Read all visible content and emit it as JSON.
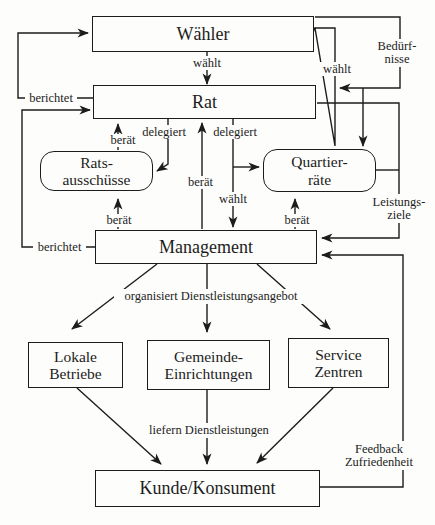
{
  "diagram": {
    "type": "flowchart",
    "language": "de",
    "colors": {
      "line": "#1c1c1c",
      "background": "#fdfdfb",
      "text": "#1c1c1c"
    },
    "nodes": {
      "waehler": {
        "label": "Wähler"
      },
      "rat": {
        "label": "Rat"
      },
      "ratsausschuesse": {
        "line1": "Rats-",
        "line2": "ausschüsse"
      },
      "quartierraete": {
        "line1": "Quartier-",
        "line2": "räte"
      },
      "management": {
        "label": "Management"
      },
      "lokale_betriebe": {
        "line1": "Lokale",
        "line2": "Betriebe"
      },
      "gemeinde_einrichtungen": {
        "line1": "Gemeinde-",
        "line2": "Einrichtungen"
      },
      "service_zentren": {
        "line1": "Service",
        "line2": "Zentren"
      },
      "kunde": {
        "label": "Kunde/Konsument"
      }
    },
    "edge_labels": {
      "waehlt_top": "wählt",
      "waehlt_right": "wählt",
      "waehlt_center": "wählt",
      "beduerfnisse_1": "Bedürf-",
      "beduerfnisse_2": "nisse",
      "berichtet_top": "berichtet",
      "berichtet_bottom": "berichtet",
      "beraet_ra_rat": "berät",
      "beraet_center": "berät",
      "beraet_mgmt_ra": "berät",
      "beraet_mgmt_qr": "berät",
      "delegiert_left": "delegiert",
      "delegiert_right": "delegiert",
      "leistungsziele_1": "Leistungs-",
      "leistungsziele_2": "ziele",
      "organisiert": "organisiert Dienstleistungsangebot",
      "liefern": "liefern Dienstleistungen",
      "feedback_1": "Feedback",
      "feedback_2": "Zufriedenheit"
    }
  }
}
